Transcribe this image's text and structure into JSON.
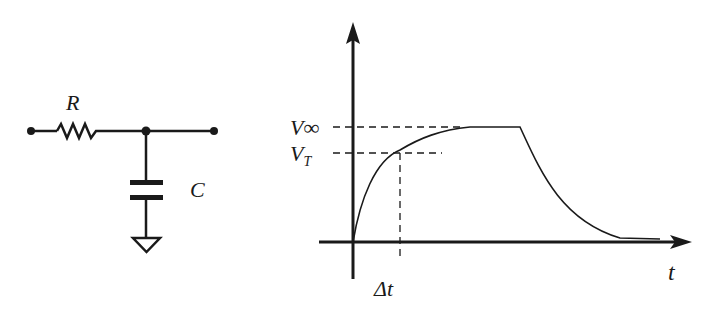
{
  "circuit": {
    "resistor_label": "R",
    "capacitor_label": "C"
  },
  "graph": {
    "y_label_high": "V∞",
    "y_label_threshold_main": "V",
    "y_label_threshold_sub": "T",
    "x_axis_label": "t",
    "delta_label": "Δt"
  },
  "colors": {
    "ink": "#1a1a1a",
    "background": "#ffffff"
  }
}
